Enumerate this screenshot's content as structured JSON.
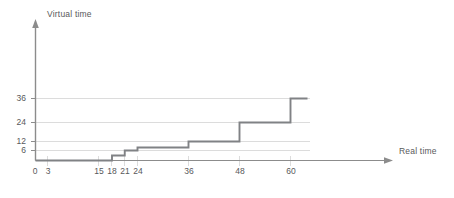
{
  "chart_data": {
    "type": "line",
    "subtype": "step-post",
    "title": "",
    "xlabel": "Real time",
    "ylabel": "Virtual time",
    "grid": true,
    "legend": null,
    "xlim": [
      0,
      70
    ],
    "ylim": [
      0,
      42
    ],
    "x_ticks": [
      0,
      3,
      15,
      18,
      21,
      24,
      36,
      48,
      60
    ],
    "x_tick_labels": [
      "0",
      "3",
      "15",
      "18",
      "21",
      "24",
      "36",
      "48",
      "60"
    ],
    "y_ticks": [
      6,
      12,
      24,
      36
    ],
    "y_tick_labels": [
      "6",
      "12",
      "24",
      "36"
    ],
    "series": [
      {
        "name": "virtual time",
        "step_points": [
          {
            "x": 0,
            "y": 0
          },
          {
            "x": 18,
            "y": 0
          },
          {
            "x": 18,
            "y": 3
          },
          {
            "x": 21,
            "y": 3
          },
          {
            "x": 21,
            "y": 6
          },
          {
            "x": 24,
            "y": 6
          },
          {
            "x": 24,
            "y": 8
          },
          {
            "x": 36,
            "y": 8
          },
          {
            "x": 36,
            "y": 12
          },
          {
            "x": 48,
            "y": 12
          },
          {
            "x": 48,
            "y": 24
          },
          {
            "x": 60,
            "y": 24
          },
          {
            "x": 60,
            "y": 36
          },
          {
            "x": 64,
            "y": 36
          }
        ]
      }
    ]
  },
  "axes": {
    "y_title": "Virtual time",
    "x_title": "Real time"
  },
  "colors": {
    "line": "#808285",
    "axis": "#808285",
    "grid": "#d9d9d9",
    "text": "#58595b",
    "background": "#ffffff"
  },
  "artifact": {
    "corner_text": ""
  }
}
